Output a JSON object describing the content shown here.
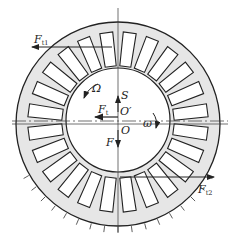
{
  "diagram": {
    "type": "rotor-stator cross-section with forces",
    "colors": {
      "stroke": "#222222",
      "fill_annulus": "#e6e6e6",
      "fill_inner": "#ffffff",
      "background": "#ffffff"
    },
    "geometry": {
      "center_O": [
        118,
        124
      ],
      "center_O_prime": [
        118,
        116
      ],
      "outer_radius": 102,
      "inner_radius": 52,
      "slot_count": 24
    },
    "labels": {
      "F_t1": {
        "main": "F",
        "sub": "t1"
      },
      "F_t2": {
        "main": "F",
        "sub": "t2"
      },
      "F_t": {
        "main": "F",
        "sub": "t"
      },
      "Omega": "Ω",
      "omega": "ω",
      "S": "S",
      "O_prime": "O′",
      "O": "O",
      "F": "F"
    }
  }
}
